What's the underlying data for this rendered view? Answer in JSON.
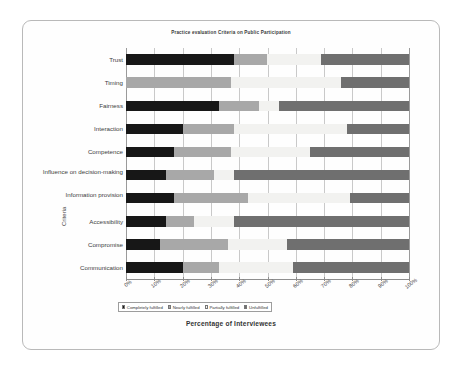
{
  "chart_data": {
    "type": "bar",
    "orientation": "horizontal",
    "stacked": "100%",
    "title": "Practice evaluation Criteria on Public Participation",
    "xlabel": "Percentage of Interviewees",
    "ylabel": "Criteria",
    "xlim": [
      0,
      100
    ],
    "grid": true,
    "legend_position": "bottom",
    "xticks": [
      "0%",
      "10%",
      "20%",
      "30%",
      "40%",
      "50%",
      "60%",
      "70%",
      "80%",
      "90%",
      "100%"
    ],
    "xtick_values": [
      0,
      10,
      20,
      30,
      40,
      50,
      60,
      70,
      80,
      90,
      100
    ],
    "categories": [
      "Trust",
      "Timing",
      "Fairness",
      "Interaction",
      "Competence",
      "Influence on decision-making",
      "Information provision",
      "Accessibility",
      "Compromise",
      "Communication"
    ],
    "series": [
      {
        "name": "Completely fulfilled",
        "color": "#171717",
        "values": [
          38,
          0,
          33,
          20,
          17,
          14,
          17,
          14,
          12,
          20
        ]
      },
      {
        "name": "Nearly fulfilled",
        "color": "#a8a8a8",
        "values": [
          12,
          37,
          14,
          18,
          20,
          17,
          26,
          10,
          24,
          13
        ]
      },
      {
        "name": "Partially fulfilled",
        "color": "#f2f2f0",
        "values": [
          19,
          39,
          7,
          40,
          28,
          7,
          36,
          14,
          21,
          26
        ]
      },
      {
        "name": "Unfulfilled",
        "color": "#6f6f6f",
        "values": [
          31,
          24,
          46,
          22,
          35,
          62,
          21,
          62,
          43,
          41
        ]
      }
    ]
  }
}
